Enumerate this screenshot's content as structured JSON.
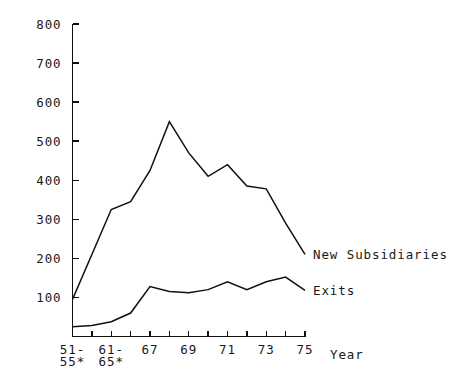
{
  "chart_data": {
    "type": "line",
    "title": "",
    "xlabel": "Year",
    "ylabel": "",
    "ylim": [
      0,
      800
    ],
    "yticks": [
      100,
      200,
      300,
      400,
      500,
      600,
      700,
      800
    ],
    "ytick_labels": [
      "100",
      "200",
      "300",
      "400",
      "500",
      "600",
      "700",
      "800"
    ],
    "grid": false,
    "legend_position": "right-inline-at-line-end",
    "categories": [
      "51-55*",
      "56-60",
      "61-65*",
      "66",
      "67",
      "68",
      "69",
      "70",
      "71",
      "72",
      "73",
      "74",
      "75"
    ],
    "xtick_labels_visible": [
      "51-\n55*",
      "61-\n65*",
      "67",
      "69",
      "71",
      "73",
      "75"
    ],
    "xtick_labels_line1": [
      "51-",
      "61-",
      "67",
      "69",
      "71",
      "73",
      "75"
    ],
    "xtick_labels_line2": [
      "55*",
      "65*",
      "",
      "",
      "",
      "",
      ""
    ],
    "series": [
      {
        "name": "New Subsidiaries",
        "values": [
          95,
          210,
          325,
          345,
          425,
          550,
          470,
          410,
          440,
          385,
          378,
          290,
          210
        ]
      },
      {
        "name": "Exits",
        "values": [
          25,
          28,
          38,
          60,
          128,
          115,
          112,
          120,
          140,
          120,
          140,
          152,
          118
        ]
      }
    ],
    "footnote_marker": "*",
    "axis_color": "#101010",
    "line_color": "#101010",
    "background_color": "#ffffff"
  },
  "labels": {
    "series_new_subsidiaries": "New Subsidiaries",
    "series_exits": "Exits",
    "x_axis_title": "Year"
  }
}
